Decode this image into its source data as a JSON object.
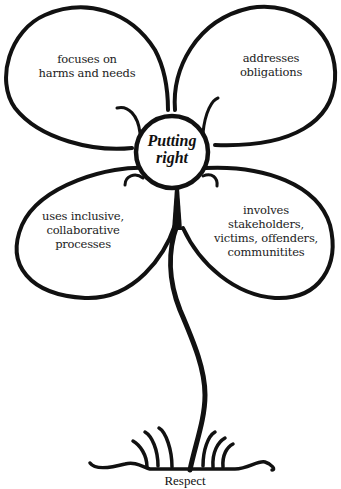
{
  "diagram": {
    "center": {
      "lines": [
        "Putting",
        "right"
      ]
    },
    "petals": [
      {
        "position": "top-left",
        "lines": [
          "focuses on",
          "harms and needs"
        ]
      },
      {
        "position": "top-right",
        "lines": [
          "addresses",
          "obligations"
        ]
      },
      {
        "position": "bottom-left",
        "lines": [
          "uses inclusive,",
          "collaborative",
          "processes"
        ]
      },
      {
        "position": "bottom-right",
        "lines": [
          "involves",
          "stakeholders,",
          "victims, offenders,",
          "communitites"
        ]
      }
    ],
    "ground": {
      "label": "Respect"
    },
    "colors": {
      "ink": "#111111",
      "background": "#ffffff"
    }
  }
}
